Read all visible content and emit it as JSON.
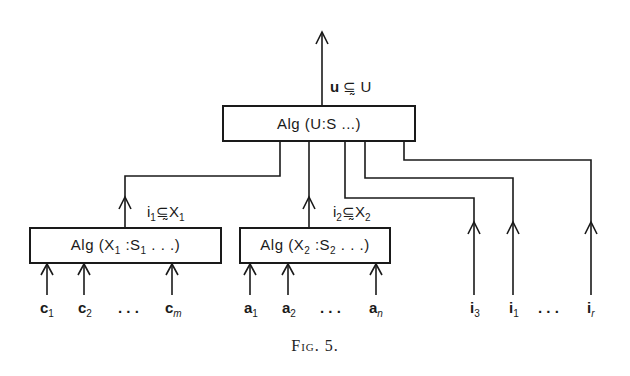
{
  "figure": {
    "caption": "Fig. 5.",
    "top_box": {
      "label": "Alg (U:S ...)"
    },
    "top_output": {
      "var": "u",
      "relation": "⊆̰",
      "set": "U"
    },
    "left_box": {
      "label_prefix": "Alg (X",
      "sub1": "1",
      "mid": " :S",
      "sub2": "1",
      "suffix": " . . .)"
    },
    "left_output": {
      "var": "i",
      "var_sub": "1",
      "relation": "⊆̰",
      "set": "X",
      "set_sub": "1"
    },
    "middle_box": {
      "label_prefix": "Alg (X",
      "sub1": "2",
      "mid": " :S",
      "sub2": "2",
      "suffix": " . . .)"
    },
    "middle_output": {
      "var": "i",
      "var_sub": "2",
      "relation": "⊆̰",
      "set": "X",
      "set_sub": "2"
    },
    "left_inputs": [
      {
        "var": "c",
        "sub": "1"
      },
      {
        "var": "c",
        "sub": "2"
      },
      {
        "var": "c",
        "sub": "m"
      }
    ],
    "middle_inputs": [
      {
        "var": "a",
        "sub": "1"
      },
      {
        "var": "a",
        "sub": "2"
      },
      {
        "var": "a",
        "sub": "n"
      }
    ],
    "right_inputs": [
      {
        "var": "i",
        "sub": "3"
      },
      {
        "var": "i",
        "sub": "1"
      },
      {
        "var": "i",
        "sub": "r"
      }
    ],
    "ellipsis": ". . ."
  }
}
